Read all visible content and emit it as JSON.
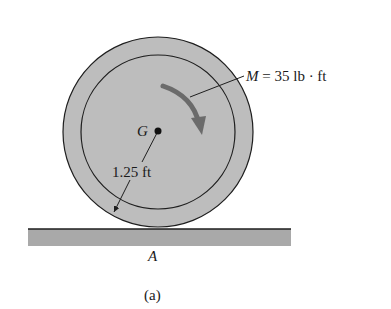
{
  "figure": {
    "caption": "(a)",
    "labels": {
      "center": "G",
      "contact_point": "A",
      "moment": {
        "symbol": "M",
        "equals": " = 35 lb · ft"
      },
      "radius": "1.25 ft"
    },
    "colors": {
      "disk_fill": "#bdbdbd",
      "disk_stroke": "#1e1e1e",
      "ground_fill": "#a9a9a9",
      "arrow": "#6b6b6b",
      "background": "#ffffff"
    }
  }
}
